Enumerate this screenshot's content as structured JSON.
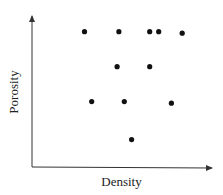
{
  "chart_data": {
    "type": "scatter",
    "title": "",
    "xlabel": "Density",
    "ylabel": "Porosity",
    "grid": false,
    "legend": null,
    "axis_ticks": "none (unlabeled axes with arrowheads)",
    "xlim": [
      0,
      10
    ],
    "ylim": [
      0,
      10
    ],
    "series": [
      {
        "name": "samples",
        "color": "#111111",
        "points": [
          {
            "x": 2.9,
            "y": 8.9
          },
          {
            "x": 4.8,
            "y": 8.9
          },
          {
            "x": 6.5,
            "y": 8.9
          },
          {
            "x": 7.0,
            "y": 8.9
          },
          {
            "x": 8.3,
            "y": 8.8
          },
          {
            "x": 4.7,
            "y": 6.6
          },
          {
            "x": 6.5,
            "y": 6.6
          },
          {
            "x": 3.3,
            "y": 4.3
          },
          {
            "x": 5.1,
            "y": 4.3
          },
          {
            "x": 7.7,
            "y": 4.2
          },
          {
            "x": 5.5,
            "y": 1.8
          }
        ]
      }
    ]
  },
  "layout": {
    "plot_px": {
      "x0": 32,
      "y0": 167,
      "x1": 213,
      "y1": 15
    },
    "axis_color": "#333333",
    "point_radius": 2.6
  }
}
